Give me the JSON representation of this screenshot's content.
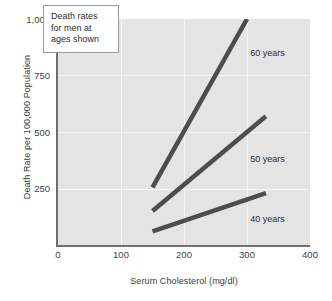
{
  "chart_data": {
    "type": "line",
    "title": "",
    "xlabel": "Serum Cholesterol (mg/dl)",
    "ylabel": "Death Rate per 100,000 Population",
    "xlim": [
      0,
      400
    ],
    "ylim": [
      0,
      1000
    ],
    "xticks": [
      "0",
      "100",
      "200",
      "300",
      "400"
    ],
    "xtick_values": [
      0,
      100,
      200,
      300,
      400
    ],
    "yticks": [
      "250",
      "500",
      "750",
      "1,000"
    ],
    "ytick_values": [
      250,
      500,
      750,
      1000
    ],
    "grid": true,
    "legend_position": "inline-right-of-lines",
    "annotation": {
      "line1": "Death rates",
      "line2": "for men at",
      "line3": "ages shown"
    },
    "series": [
      {
        "name": "60 years",
        "label": "60 years",
        "color": "#4d4d4d",
        "x": [
          150,
          300
        ],
        "values": [
          255,
          1000
        ],
        "label_x": 305,
        "label_y": 845
      },
      {
        "name": "50 years",
        "label": "50 years",
        "color": "#4d4d4d",
        "x": [
          150,
          330
        ],
        "values": [
          150,
          570
        ],
        "label_x": 305,
        "label_y": 375
      },
      {
        "name": "40 years",
        "label": "40 years",
        "color": "#4d4d4d",
        "x": [
          150,
          330
        ],
        "values": [
          60,
          230
        ],
        "label_x": 305,
        "label_y": 110
      }
    ]
  },
  "axis": {
    "ytick_1000": "1,000",
    "ytick_750": "750",
    "ytick_500": "500",
    "ytick_250": "250",
    "xtick_0": "0",
    "xtick_100": "100",
    "xtick_200": "200",
    "xtick_300": "300",
    "xtick_400": "400"
  },
  "colors": {
    "panel": "#e4e4e4",
    "grid": "#f6f6f6",
    "line": "#4d4d4d",
    "axis": "#6e6e6e",
    "text": "#2e2e2e"
  }
}
